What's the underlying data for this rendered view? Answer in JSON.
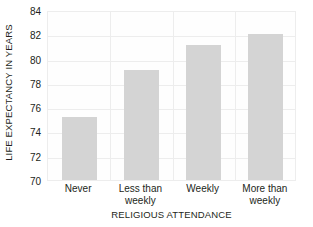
{
  "chart_data": {
    "type": "bar",
    "title": "",
    "subtitle": "",
    "xlabel": "RELIGIOUS ATTENDANCE",
    "ylabel": "LIFE EXPECTANCY IN YEARS",
    "categories": [
      "Never",
      "Less than weekly",
      "Weekly",
      "More than weekly"
    ],
    "category_lines": [
      [
        "Never"
      ],
      [
        "Less than",
        "weekly"
      ],
      [
        "Weekly"
      ],
      [
        "More than",
        "weekly"
      ]
    ],
    "values": [
      75.2,
      79.1,
      81.1,
      82.0
    ],
    "ylim": [
      70,
      84
    ],
    "yticks": [
      70,
      72,
      74,
      76,
      78,
      80,
      82,
      84
    ],
    "ytick_labels": [
      "70",
      "72",
      "74",
      "76",
      "78",
      "80",
      "82",
      "84"
    ],
    "grid": true,
    "grid_axis": "both",
    "legend": false,
    "legend_position": "none",
    "bar_color": "#d4d4d4",
    "gridline_color": "#ededed",
    "text_color": "#231f20",
    "plot_background": "#fefefe",
    "page_background": "#ffffff"
  }
}
